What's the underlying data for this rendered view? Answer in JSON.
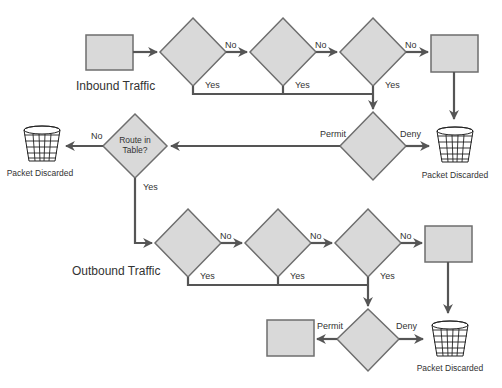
{
  "diagram": {
    "type": "flowchart",
    "colors": {
      "shape_fill": "#d9d9d9",
      "shape_stroke": "#6e6e6e",
      "line": "#555555",
      "text": "#333333"
    },
    "inbound": {
      "title": "Inbound Traffic",
      "branch_no": [
        "No",
        "No",
        "No"
      ],
      "branch_yes": [
        "Yes",
        "Yes",
        "Yes"
      ],
      "acl": {
        "permit": "Permit",
        "deny": "Deny"
      },
      "discard": "Packet Discarded"
    },
    "routing": {
      "decision": "Route in Table?",
      "decision_line1": "Route in",
      "decision_line2": "Table?",
      "no": "No",
      "yes": "Yes",
      "discard": "Packet Discarded"
    },
    "outbound": {
      "title": "Outbound Traffic",
      "branch_no": [
        "No",
        "No",
        "No"
      ],
      "branch_yes": [
        "Yes",
        "Yes",
        "Yes"
      ],
      "acl": {
        "permit": "Permit",
        "deny": "Deny"
      },
      "discard": "Packet Discarded"
    }
  }
}
